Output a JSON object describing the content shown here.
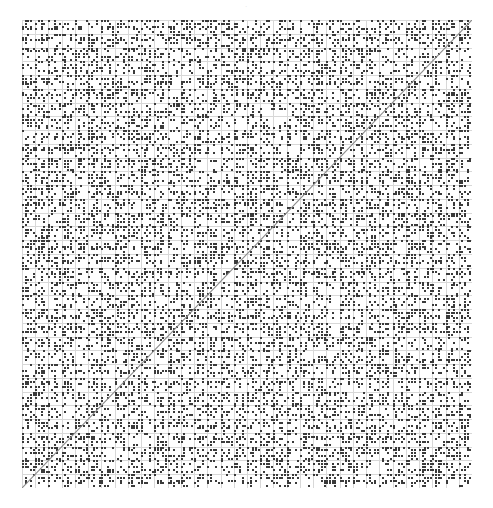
{
  "figure": {
    "header_artifact": "·",
    "background_color": "#ffffff",
    "width": 493,
    "height": 508
  },
  "plot": {
    "x": 22,
    "y": 20,
    "width": 450,
    "height": 468
  },
  "chart_data": {
    "type": "heatmap",
    "title": "",
    "subtitle": "",
    "xlabel": "",
    "ylabel": "",
    "xlim": [
      0,
      34
    ],
    "ylim": [
      0,
      34
    ],
    "grid": true,
    "legend": false,
    "legend_position": "none",
    "xticklabels": [],
    "yticklabels": [],
    "grid_columns": 34,
    "grid_rows": 34,
    "cell_width": 13.235,
    "cell_height": 13.765,
    "mark_color": "#3a3a3a",
    "gridline_color": "#d8d8d8",
    "fill_density": 0.42,
    "reference_line": {
      "label": "diagonal",
      "x": [
        0,
        34
      ],
      "y": [
        0,
        34
      ],
      "color": "#8a8a8a",
      "width": 1.1,
      "style": "solid"
    },
    "series": [
      {
        "name": "cell_marks",
        "note": "Each grid cell contains a small pseudo-random pattern of dark pixels (approximately 3x3 to 5x5 sub-blocks), producing the dense texture.",
        "values": []
      }
    ]
  }
}
